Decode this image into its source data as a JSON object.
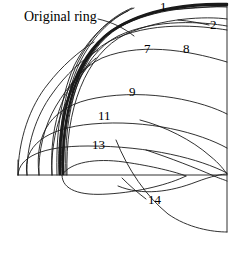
{
  "figure": {
    "title_annotation": "Original ring",
    "background_color": "#ffffff",
    "line_color": "#1a1a1a",
    "width": 239,
    "height": 260
  },
  "annotations": {
    "original_ring": {
      "text": "Original ring",
      "x": 24,
      "y": 16
    },
    "curve_labels": [
      {
        "text": "1",
        "x": 160,
        "y": 2
      },
      {
        "text": "2",
        "x": 210,
        "y": 21
      },
      {
        "text": "7",
        "x": 144,
        "y": 45
      },
      {
        "text": "8",
        "x": 183,
        "y": 45
      },
      {
        "text": "9",
        "x": 129,
        "y": 88
      },
      {
        "text": "11",
        "x": 98,
        "y": 112
      },
      {
        "text": "13",
        "x": 92,
        "y": 141
      },
      {
        "text": "14",
        "x": 148,
        "y": 196
      }
    ]
  },
  "chart_data": {
    "type": "line",
    "xlabel": "",
    "ylabel": "",
    "grid": false,
    "legend": "none",
    "axis": {
      "baseline_y": 175,
      "baseline_x_start": 18,
      "baseline_x_end": 227,
      "right_edge_x": 227,
      "right_edge_y_top": 4,
      "right_edge_y_bottom": 232
    },
    "series": [
      {
        "name": "Original ring",
        "label": "1",
        "style": "thick",
        "path": "M 60,174 C 58,120 72,60 110,32 C 145,8 195,4 227,5"
      },
      {
        "name": "ring-outer-2",
        "label": "1",
        "style": "thick",
        "path": "M 63,174 C 61,118 76,56 113,30 C 148,7 197,3 227,4"
      },
      {
        "name": "curve-1",
        "label": "1",
        "style": "thin",
        "path": "M 65,174 C 64,116 80,54 118,30 C 152,10 200,7 227,8"
      },
      {
        "name": "curve-2",
        "label": "2",
        "style": "thin",
        "path": "M 66,174 C 66,114 84,58 124,38 C 160,22 205,18 227,20"
      },
      {
        "name": "curve-7",
        "label": "7",
        "style": "thin",
        "path": "M 60,174 C 58,118 74,62 110,40 C 150,18 200,24 227,28"
      },
      {
        "name": "curve-8",
        "label": "8",
        "style": "thin",
        "path": "M 52,174 C 50,120 66,74 104,56 C 148,38 200,52 227,60"
      },
      {
        "name": "curve-9",
        "label": "9",
        "style": "thin",
        "path": "M 38,174 C 34,130 52,106 96,98 C 150,88 204,100 227,112"
      },
      {
        "name": "curve-11",
        "label": "11",
        "style": "thin",
        "path": "M 26,174 C 22,144 46,128 92,124 C 148,120 200,132 227,146"
      },
      {
        "name": "curve-13",
        "label": "13",
        "style": "thin",
        "path": "M 18,174 C 18,156 42,146 88,146 C 150,146 200,158 227,172"
      },
      {
        "name": "curve-14",
        "label": "14",
        "style": "thin",
        "path": "M 62,176 C 74,202 104,196 132,182 C 162,166 196,166 227,174"
      },
      {
        "name": "curve-14-descending",
        "label": "14",
        "style": "thin",
        "path": "M 118,150 C 134,178 150,204 172,218 C 194,230 214,232 227,232"
      },
      {
        "name": "lower-loop",
        "label": "",
        "style": "thin",
        "path": "M 62,174 C 62,198 84,196 112,188 C 142,180 164,170 176,160"
      }
    ]
  }
}
